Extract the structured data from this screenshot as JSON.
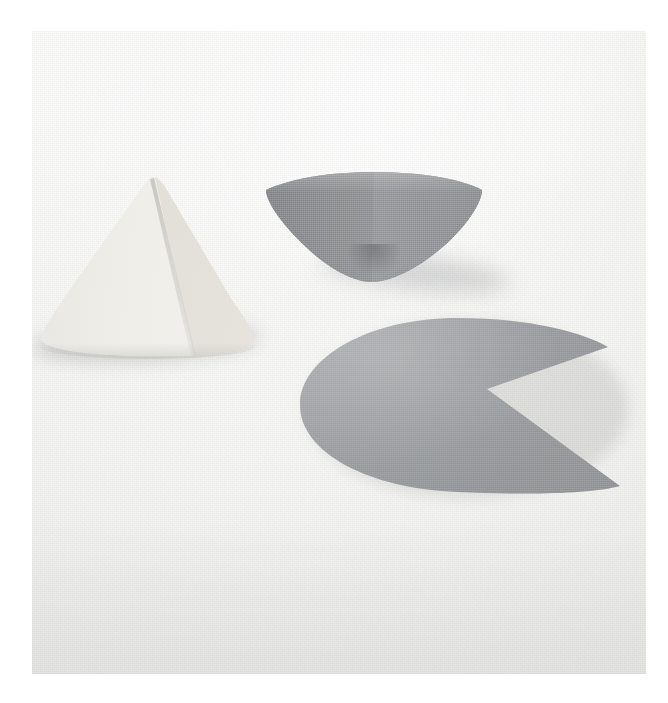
{
  "image": {
    "kind": "photograph",
    "title": "Three paper geometric shapes on white cloth",
    "surface": "white woven fabric backdrop",
    "lighting": "soft diffuse light from upper right",
    "background_color": "#f5f5f3",
    "border_color": "#ffffff",
    "frame": {
      "left": 32,
      "top": 31,
      "width": 614,
      "height": 643
    }
  },
  "objects": [
    {
      "id": "cone-left",
      "label": "Paper cone, apex up",
      "shape": "cone",
      "orientation": "upright, point up",
      "color": "#eceae5",
      "shade_color": "#ddd9d3",
      "detail": "visible vertical seam / fold line running from apex to base",
      "bounds": {
        "left": 18,
        "top": 175,
        "width": 255,
        "height": 200
      }
    },
    {
      "id": "bowl",
      "label": "Inverted paper cone forming a bowl",
      "shape": "inverted-cone",
      "orientation": "point down, open mouth up",
      "color": "#9a9c9f",
      "shade_color": "#85878a",
      "detail": "woven card texture, concave interior, elliptical rim",
      "bounds": {
        "left": 258,
        "top": 168,
        "width": 240,
        "height": 130
      }
    },
    {
      "id": "pacman",
      "label": "Flat disc with wedge removed",
      "shape": "circle-sector-cutout",
      "orientation": "flat on surface, wedge opening to the right",
      "color": "#a0a2a5",
      "detail": "pac-man silhouette; the removed sector is the net that forms a cone",
      "bounds": {
        "left": 288,
        "top": 305,
        "width": 344,
        "height": 200
      }
    }
  ],
  "annotations": {
    "caption": "",
    "alt_text": "Three pale geometric paper forms photographed on a white cloth: a light cone standing point-up at left, a grey inverted cone resting like a bowl at top centre, and a flat grey disc with a wedge cut out lying at lower right."
  }
}
